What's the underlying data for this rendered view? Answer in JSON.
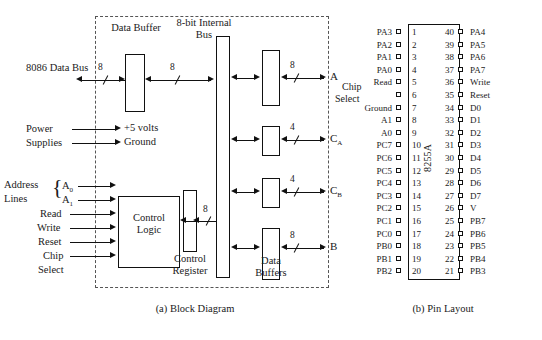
{
  "figure": {
    "captions": {
      "a": "(a) Block Diagram",
      "b": "(b) Pin Layout"
    }
  },
  "block_diagram": {
    "blocks": [
      {
        "id": "data_buffer",
        "label": "Data Buffer"
      },
      {
        "id": "internal_bus",
        "label": "8-bit Internal Bus"
      },
      {
        "id": "control_logic",
        "label": "Control Logic"
      },
      {
        "id": "control_register",
        "label": "Control Register"
      },
      {
        "id": "data_buffers",
        "label": "Data Buffers"
      }
    ],
    "left_inputs": [
      {
        "id": "data_bus",
        "label": "8086 Data Bus",
        "width": "8"
      },
      {
        "id": "power",
        "label": "Power"
      },
      {
        "id": "supplies",
        "label": "Supplies"
      },
      {
        "id": "plus5",
        "label": "+5 volts"
      },
      {
        "id": "ground",
        "label": "Ground"
      },
      {
        "id": "address",
        "label": "Address"
      },
      {
        "id": "lines",
        "label": "Lines"
      },
      {
        "id": "a0",
        "label": "A",
        "subscript": "0"
      },
      {
        "id": "a1",
        "label": "A",
        "subscript": "1"
      },
      {
        "id": "read",
        "label": "Read"
      },
      {
        "id": "write",
        "label": "Write"
      },
      {
        "id": "reset",
        "label": "Reset"
      },
      {
        "id": "chip",
        "label": "Chip"
      },
      {
        "id": "select",
        "label": "Select"
      }
    ],
    "ports": [
      {
        "id": "port_a",
        "label": "A",
        "subscript": "",
        "width": "8"
      },
      {
        "id": "port_ca",
        "label": "C",
        "subscript": "A",
        "width": "4"
      },
      {
        "id": "port_cb",
        "label": "C",
        "subscript": "B",
        "width": "4"
      },
      {
        "id": "port_b",
        "label": "B",
        "subscript": "",
        "width": "8"
      }
    ],
    "bus_widths": {
      "external": "8",
      "internal": "8",
      "control_register": "8"
    }
  },
  "pin_layout": {
    "chip_name": "8255A",
    "annotation": {
      "line1": "Chip",
      "line2": "Select"
    },
    "left_pins": [
      {
        "num": "1",
        "name": "PA3"
      },
      {
        "num": "2",
        "name": "PA2"
      },
      {
        "num": "3",
        "name": "PA1"
      },
      {
        "num": "4",
        "name": "PA0"
      },
      {
        "num": "5",
        "name": "Read"
      },
      {
        "num": "6",
        "name": ""
      },
      {
        "num": "7",
        "name": "Ground"
      },
      {
        "num": "8",
        "name": "A1"
      },
      {
        "num": "9",
        "name": "A0"
      },
      {
        "num": "10",
        "name": "PC7"
      },
      {
        "num": "11",
        "name": "PC6"
      },
      {
        "num": "12",
        "name": "PC5"
      },
      {
        "num": "13",
        "name": "PC4"
      },
      {
        "num": "14",
        "name": "PC3"
      },
      {
        "num": "15",
        "name": "PC2"
      },
      {
        "num": "16",
        "name": "PC1"
      },
      {
        "num": "17",
        "name": "PC0"
      },
      {
        "num": "18",
        "name": "PB0"
      },
      {
        "num": "19",
        "name": "PB1"
      },
      {
        "num": "20",
        "name": "PB2"
      }
    ],
    "right_pins": [
      {
        "num": "40",
        "name": "PA4"
      },
      {
        "num": "39",
        "name": "PA5"
      },
      {
        "num": "38",
        "name": "PA6"
      },
      {
        "num": "37",
        "name": "PA7"
      },
      {
        "num": "36",
        "name": "Write"
      },
      {
        "num": "35",
        "name": "Reset"
      },
      {
        "num": "34",
        "name": "D0"
      },
      {
        "num": "33",
        "name": "D1"
      },
      {
        "num": "32",
        "name": "D2"
      },
      {
        "num": "31",
        "name": "D3"
      },
      {
        "num": "30",
        "name": "D4"
      },
      {
        "num": "29",
        "name": "D5"
      },
      {
        "num": "28",
        "name": "D6"
      },
      {
        "num": "27",
        "name": "D7"
      },
      {
        "num": "26",
        "name": "V"
      },
      {
        "num": "25",
        "name": "PB7"
      },
      {
        "num": "24",
        "name": "PB6"
      },
      {
        "num": "23",
        "name": "PB5"
      },
      {
        "num": "22",
        "name": "PB4"
      },
      {
        "num": "21",
        "name": "PB3"
      }
    ]
  }
}
